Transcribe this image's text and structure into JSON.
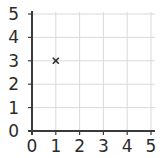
{
  "chart_data": {
    "type": "scatter",
    "title": "",
    "xlabel": "",
    "ylabel": "",
    "xlim": [
      0,
      5
    ],
    "ylim": [
      0,
      5
    ],
    "grid": true,
    "x_ticks": [
      "0",
      "1",
      "2",
      "3",
      "4",
      "5"
    ],
    "y_ticks": [
      "0",
      "1",
      "2",
      "3",
      "4",
      "5"
    ],
    "series": [
      {
        "name": "points",
        "marker": "x",
        "points": [
          {
            "x": 1,
            "y": 3
          }
        ]
      }
    ]
  },
  "colors": {
    "axis": "#3a3a3a",
    "grid": "#d9d9d9",
    "marker": "#2b2b2b",
    "text": "#2b2b2b"
  }
}
